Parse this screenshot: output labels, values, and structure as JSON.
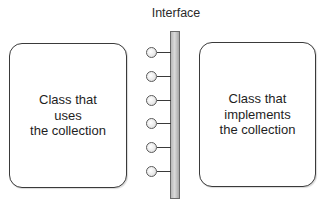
{
  "diagram": {
    "interface_label": "Interface",
    "left_box": {
      "lines": [
        "Class that",
        "uses",
        "the collection"
      ]
    },
    "right_box": {
      "lines": [
        "Class that",
        "implements",
        "the collection"
      ]
    },
    "interface_connectors": {
      "count": 6,
      "y_positions": [
        47,
        71,
        95,
        118,
        142,
        166
      ]
    },
    "colors": {
      "box_border": "#3a3a3a",
      "bar_fill": "#c4c4c4",
      "connector_circle": "#e8e8e8",
      "text": "#1e1e1e"
    }
  }
}
